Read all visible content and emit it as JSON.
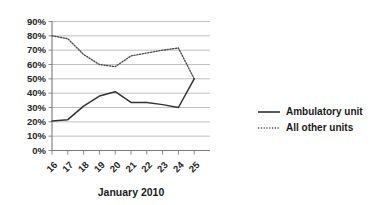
{
  "chart_data": {
    "type": "line",
    "title": "",
    "xlabel": "January 2010",
    "ylabel": "",
    "categories": [
      "16",
      "17",
      "18",
      "19",
      "20",
      "21",
      "22",
      "23",
      "24",
      "25"
    ],
    "ylim": [
      0,
      90
    ],
    "ytick_labels": [
      "0%",
      "10%",
      "20%",
      "30%",
      "40%",
      "50%",
      "60%",
      "70%",
      "80%",
      "90%"
    ],
    "ytick_values": [
      0,
      10,
      20,
      30,
      40,
      50,
      60,
      70,
      80,
      90
    ],
    "grid": true,
    "legend_position": "right",
    "series": [
      {
        "name": "Ambulatory unit",
        "style": "solid",
        "color": "#333333",
        "values": [
          20.5,
          21.5,
          31,
          38,
          41,
          33.5,
          33.5,
          32,
          30,
          50
        ]
      },
      {
        "name": "All other units",
        "style": "dotted",
        "color": "#4d4d4d",
        "values": [
          80,
          78,
          67,
          60,
          58.5,
          66,
          68,
          70,
          71.5,
          50
        ]
      }
    ]
  },
  "legend": {
    "items": [
      {
        "label": "Ambulatory unit"
      },
      {
        "label": "All other units"
      }
    ]
  }
}
